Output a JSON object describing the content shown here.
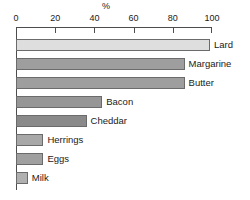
{
  "chart_data": {
    "type": "bar",
    "orientation": "horizontal",
    "title": "",
    "xlabel": "%",
    "ylabel": "",
    "xlim": [
      0,
      100
    ],
    "xticks": [
      0,
      20,
      40,
      60,
      80,
      100
    ],
    "grid": false,
    "legend": "none",
    "categories": [
      "Lard",
      "Margarine",
      "Butter",
      "Bacon",
      "Cheddar",
      "Herrings",
      "Eggs",
      "Milk"
    ],
    "values": [
      99,
      86,
      86,
      44,
      36,
      14,
      14,
      6
    ],
    "bar_colors": [
      "#dedede",
      "#9e9e9e",
      "#9e9e9e",
      "#969696",
      "#8a8a8a",
      "#a8a8a8",
      "#a0a0a0",
      "#b0b0b0"
    ],
    "bars": [
      {
        "label": "Lard",
        "value": 99,
        "color": "#dedede"
      },
      {
        "label": "Margarine",
        "value": 86,
        "color": "#9e9e9e"
      },
      {
        "label": "Butter",
        "value": 86,
        "color": "#9e9e9e"
      },
      {
        "label": "Bacon",
        "value": 44,
        "color": "#969696"
      },
      {
        "label": "Cheddar",
        "value": 36,
        "color": "#8a8a8a"
      },
      {
        "label": "Herrings",
        "value": 14,
        "color": "#a8a8a8"
      },
      {
        "label": "Eggs",
        "value": 14,
        "color": "#a0a0a0"
      },
      {
        "label": "Milk",
        "value": 6,
        "color": "#b0b0b0"
      }
    ]
  },
  "axis": {
    "unit_label": "%",
    "tick_labels": [
      "0",
      "20",
      "40",
      "60",
      "80",
      "100"
    ],
    "line_color": "#4d4d4d"
  },
  "colors": {
    "background": "#ffffff",
    "text": "#1a1a1a",
    "bar_outline": "#6b6b6b"
  }
}
